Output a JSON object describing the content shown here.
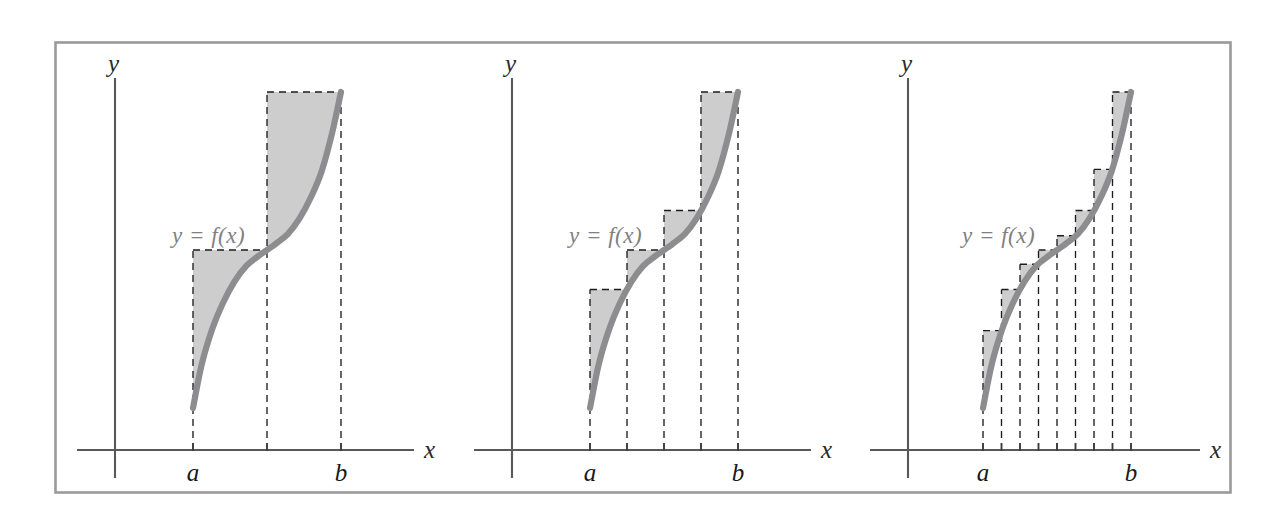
{
  "figure": {
    "background_color": "#ffffff",
    "frame_color": "#9a9a9c",
    "curve_color": "#8d8d90",
    "shade_color": "#c9c9c9",
    "dash_color": "#1d1d1f",
    "axis_color": "#58585a",
    "label_color": "#7f7f82"
  },
  "labels": {
    "y_axis": "y",
    "x_axis": "x",
    "lower_bound": "a",
    "upper_bound": "b",
    "function": "y = f(x)"
  },
  "panels": [
    {
      "id": "panel-1",
      "subdivisions": 2,
      "x_label": "x",
      "y_label": "y",
      "a_label": "a",
      "b_label": "b",
      "function_label": "y = f(x)"
    },
    {
      "id": "panel-2",
      "subdivisions": 4,
      "x_label": "x",
      "y_label": "y",
      "a_label": "a",
      "b_label": "b",
      "function_label": "y = f(x)"
    },
    {
      "id": "panel-3",
      "subdivisions": 8,
      "x_label": "x",
      "y_label": "y",
      "a_label": "a",
      "b_label": "b",
      "function_label": "y = f(x)"
    }
  ],
  "chart_data": {
    "type": "line",
    "xlabel": "x",
    "ylabel": "y",
    "grid": false,
    "legend": null,
    "annotations": [
      "y = f(x)",
      "a",
      "b"
    ],
    "curve_description": "Monotone increasing cubic-like sigmoid f(x) on [a, b] with an inflection near the midpoint",
    "curve_normalized_points": [
      {
        "t": 0.0,
        "f": 0.0
      },
      {
        "t": 0.06,
        "f": 0.14
      },
      {
        "t": 0.13,
        "f": 0.25
      },
      {
        "t": 0.2,
        "f": 0.33
      },
      {
        "t": 0.28,
        "f": 0.4
      },
      {
        "t": 0.36,
        "f": 0.45
      },
      {
        "t": 0.44,
        "f": 0.48
      },
      {
        "t": 0.5,
        "f": 0.5
      },
      {
        "t": 0.56,
        "f": 0.52
      },
      {
        "t": 0.64,
        "f": 0.55
      },
      {
        "t": 0.72,
        "f": 0.6
      },
      {
        "t": 0.8,
        "f": 0.67
      },
      {
        "t": 0.87,
        "f": 0.75
      },
      {
        "t": 0.94,
        "f": 0.87
      },
      {
        "t": 1.0,
        "f": 1.0
      }
    ],
    "panels": [
      {
        "name": "panel-1",
        "subdivisions": 2,
        "partition_t": [
          0,
          0.5,
          1
        ],
        "rectangle_heights_normalized": [
          0.5,
          1.0
        ]
      },
      {
        "name": "panel-2",
        "subdivisions": 4,
        "partition_t": [
          0,
          0.25,
          0.5,
          0.75,
          1
        ],
        "rectangle_heights_normalized": [
          0.375,
          0.5,
          0.625,
          1.0
        ]
      },
      {
        "name": "panel-3",
        "subdivisions": 8,
        "partition_t": [
          0,
          0.125,
          0.25,
          0.375,
          0.5,
          0.625,
          0.75,
          0.875,
          1
        ],
        "rectangle_heights_normalized": [
          0.245,
          0.375,
          0.455,
          0.5,
          0.545,
          0.625,
          0.755,
          1.0
        ]
      }
    ]
  }
}
